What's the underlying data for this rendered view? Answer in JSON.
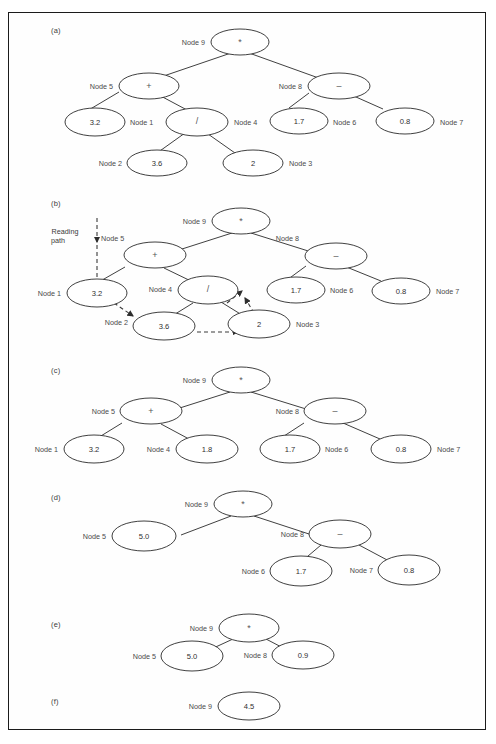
{
  "figure": {
    "kind": "expression-tree-evaluation",
    "panels": [
      {
        "letter": "(a)",
        "nodes": [
          {
            "id": "node9",
            "label": "Node 9",
            "label_side": "left",
            "value": "*",
            "type": "operator"
          },
          {
            "id": "node5",
            "label": "Node 5",
            "label_side": "left",
            "value": "+",
            "type": "operator"
          },
          {
            "id": "node8",
            "label": "Node 8",
            "label_side": "left",
            "value": "–",
            "type": "operator"
          },
          {
            "id": "node1",
            "label": "Node 1",
            "label_side": "right",
            "value": "3.2",
            "type": "value"
          },
          {
            "id": "node4",
            "label": "Node 4",
            "label_side": "right",
            "value": "/",
            "type": "operator"
          },
          {
            "id": "node6",
            "label": "Node 6",
            "label_side": "right",
            "value": "1.7",
            "type": "value"
          },
          {
            "id": "node7",
            "label": "Node 7",
            "label_side": "right",
            "value": "0.8",
            "type": "value"
          },
          {
            "id": "node2",
            "label": "Node 2",
            "label_side": "left",
            "value": "3.6",
            "type": "value"
          },
          {
            "id": "node3",
            "label": "Node 3",
            "label_side": "right",
            "value": "2",
            "type": "value"
          }
        ],
        "edges": [
          [
            "node9",
            "node5"
          ],
          [
            "node9",
            "node8"
          ],
          [
            "node5",
            "node1"
          ],
          [
            "node5",
            "node4"
          ],
          [
            "node8",
            "node6"
          ],
          [
            "node8",
            "node7"
          ],
          [
            "node4",
            "node2"
          ],
          [
            "node4",
            "node3"
          ]
        ]
      },
      {
        "letter": "(b)",
        "reading_path_label": "Reading\npath",
        "reading_path_label_line1": "Reading",
        "reading_path_label_line2": "path",
        "nodes": [
          {
            "id": "node9",
            "label": "Node 9",
            "label_side": "left",
            "value": "*",
            "type": "operator"
          },
          {
            "id": "node5",
            "label": "Node 5",
            "label_side": "left",
            "value": "+",
            "type": "operator"
          },
          {
            "id": "node8",
            "label": "Node 8",
            "label_side": "left",
            "value": "–",
            "type": "operator"
          },
          {
            "id": "node1",
            "label": "Node 1",
            "label_side": "left",
            "value": "3.2",
            "type": "value"
          },
          {
            "id": "node4",
            "label": "Node 4",
            "label_side": "left",
            "value": "/",
            "type": "operator"
          },
          {
            "id": "node6",
            "label": "Node 6",
            "label_side": "right",
            "value": "1.7",
            "type": "value"
          },
          {
            "id": "node7",
            "label": "Node 7",
            "label_side": "right",
            "value": "0.8",
            "type": "value"
          },
          {
            "id": "node2",
            "label": "Node 2",
            "label_side": "left",
            "value": "3.6",
            "type": "value"
          },
          {
            "id": "node3",
            "label": "Node 3",
            "label_side": "right",
            "value": "2",
            "type": "value"
          }
        ],
        "edges": [
          [
            "node9",
            "node5"
          ],
          [
            "node9",
            "node8"
          ],
          [
            "node5",
            "node1"
          ],
          [
            "node5",
            "node4"
          ],
          [
            "node8",
            "node6"
          ],
          [
            "node8",
            "node7"
          ],
          [
            "node4",
            "node2"
          ],
          [
            "node4",
            "node3"
          ]
        ],
        "reading_path_arrows": [
          "down-to-node1",
          "node1-to-node2",
          "node2-to-node3",
          "node3-to-node4"
        ]
      },
      {
        "letter": "(c)",
        "nodes": [
          {
            "id": "node9",
            "label": "Node 9",
            "label_side": "left",
            "value": "*",
            "type": "operator"
          },
          {
            "id": "node5",
            "label": "Node 5",
            "label_side": "left",
            "value": "+",
            "type": "operator"
          },
          {
            "id": "node8",
            "label": "Node 8",
            "label_side": "left",
            "value": "–",
            "type": "operator"
          },
          {
            "id": "node1",
            "label": "Node 1",
            "label_side": "left",
            "value": "3.2",
            "type": "value"
          },
          {
            "id": "node4",
            "label": "Node 4",
            "label_side": "left",
            "value": "1.8",
            "type": "value"
          },
          {
            "id": "node6",
            "label": "Node 6",
            "label_side": "right",
            "value": "1.7",
            "type": "value"
          },
          {
            "id": "node7",
            "label": "Node 7",
            "label_side": "right",
            "value": "0.8",
            "type": "value"
          }
        ],
        "edges": [
          [
            "node9",
            "node5"
          ],
          [
            "node9",
            "node8"
          ],
          [
            "node5",
            "node1"
          ],
          [
            "node5",
            "node4"
          ],
          [
            "node8",
            "node6"
          ],
          [
            "node8",
            "node7"
          ]
        ]
      },
      {
        "letter": "(d)",
        "nodes": [
          {
            "id": "node9",
            "label": "Node 9",
            "label_side": "left",
            "value": "*",
            "type": "operator"
          },
          {
            "id": "node5",
            "label": "Node 5",
            "label_side": "left",
            "value": "5.0",
            "type": "value"
          },
          {
            "id": "node8",
            "label": "Node 8",
            "label_side": "left",
            "value": "–",
            "type": "operator"
          },
          {
            "id": "node6",
            "label": "Node 6",
            "label_side": "left",
            "value": "1.7",
            "type": "value"
          },
          {
            "id": "node7",
            "label": "Node 7",
            "label_side": "left",
            "value": "0.8",
            "type": "value"
          }
        ],
        "edges": [
          [
            "node9",
            "node5"
          ],
          [
            "node9",
            "node8"
          ],
          [
            "node8",
            "node6"
          ],
          [
            "node8",
            "node7"
          ]
        ]
      },
      {
        "letter": "(e)",
        "nodes": [
          {
            "id": "node9",
            "label": "Node 9",
            "label_side": "left",
            "value": "*",
            "type": "operator"
          },
          {
            "id": "node5",
            "label": "Node 5",
            "label_side": "left",
            "value": "5.0",
            "type": "value"
          },
          {
            "id": "node8",
            "label": "Node 8",
            "label_side": "left",
            "value": "0.9",
            "type": "value"
          }
        ],
        "edges": [
          [
            "node9",
            "node5"
          ],
          [
            "node9",
            "node8"
          ]
        ]
      },
      {
        "letter": "(f)",
        "nodes": [
          {
            "id": "node9",
            "label": "Node 9",
            "label_side": "left",
            "value": "4.5",
            "type": "value"
          }
        ],
        "edges": []
      }
    ]
  },
  "colors": {
    "ink": "#2a2a2a",
    "label": "#4a4a4a",
    "frame": "#1b1b1b",
    "paper": "#fefefe"
  },
  "panel_a": {
    "letter": "(a)",
    "n9_label": "Node 9",
    "n9_val": "*",
    "n5_label": "Node 5",
    "n5_val": "+",
    "n8_label": "Node 8",
    "n8_val": "–",
    "n1_label": "Node 1",
    "n1_val": "3.2",
    "n4_label": "Node 4",
    "n4_val": "/",
    "n6_label": "Node 6",
    "n6_val": "1.7",
    "n7_label": "Node 7",
    "n7_val": "0.8",
    "n2_label": "Node 2",
    "n2_val": "3.6",
    "n3_label": "Node 3",
    "n3_val": "2"
  },
  "panel_b": {
    "letter": "(b)",
    "reading_l1": "Reading",
    "reading_l2": "path",
    "n9_label": "Node 9",
    "n9_val": "*",
    "n5_label": "Node 5",
    "n5_val": "+",
    "n8_label": "Node 8",
    "n8_val": "–",
    "n1_label": "Node 1",
    "n1_val": "3.2",
    "n4_label": "Node 4",
    "n4_val": "/",
    "n6_label": "Node 6",
    "n6_val": "1.7",
    "n7_label": "Node 7",
    "n7_val": "0.8",
    "n2_label": "Node 2",
    "n2_val": "3.6",
    "n3_label": "Node 3",
    "n3_val": "2"
  },
  "panel_c": {
    "letter": "(c)",
    "n9_label": "Node 9",
    "n9_val": "*",
    "n5_label": "Node 5",
    "n5_val": "+",
    "n8_label": "Node 8",
    "n8_val": "–",
    "n1_label": "Node 1",
    "n1_val": "3.2",
    "n4_label": "Node 4",
    "n4_val": "1.8",
    "n6_label": "Node 6",
    "n6_val": "1.7",
    "n7_label": "Node 7",
    "n7_val": "0.8"
  },
  "panel_d": {
    "letter": "(d)",
    "n9_label": "Node 9",
    "n9_val": "*",
    "n5_label": "Node 5",
    "n5_val": "5.0",
    "n8_label": "Node 8",
    "n8_val": "–",
    "n6_label": "Node 6",
    "n6_val": "1.7",
    "n7_label": "Node 7",
    "n7_val": "0.8"
  },
  "panel_e": {
    "letter": "(e)",
    "n9_label": "Node 9",
    "n9_val": "*",
    "n5_label": "Node 5",
    "n5_val": "5.0",
    "n8_label": "Node 8",
    "n8_val": "0.9"
  },
  "panel_f": {
    "letter": "(f)",
    "n9_label": "Node 9",
    "n9_val": "4.5"
  }
}
